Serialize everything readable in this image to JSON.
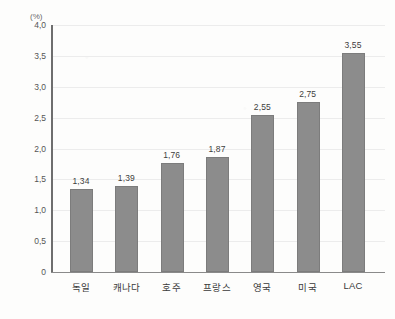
{
  "chart_data": {
    "type": "bar",
    "title": "",
    "subtitle": "",
    "xlabel": "",
    "ylabel": "GDP 중 비율",
    "unit_marker": "(%)",
    "categories": [
      "독일",
      "캐나다",
      "호주",
      "프랑스",
      "영국",
      "미국",
      "LAC"
    ],
    "values": [
      1.34,
      1.39,
      1.76,
      1.87,
      2.55,
      2.75,
      3.55
    ],
    "value_labels": [
      "1,34",
      "1,39",
      "1,76",
      "1,87",
      "2,55",
      "2,75",
      "3,55"
    ],
    "ylim": [
      0,
      4.0
    ],
    "ytick_values": [
      0,
      0.5,
      1.0,
      1.5,
      2.0,
      2.5,
      3.0,
      3.5,
      4.0
    ],
    "ytick_labels": [
      "0",
      "0,5",
      "1,0",
      "1,5",
      "2,0",
      "2,5",
      "3,0",
      "3,5",
      "4,0"
    ],
    "decimal_separator": ",",
    "grid": true,
    "grid_axis": "y",
    "legend": false,
    "legend_position": "none",
    "bar_color": "#8c8c8c",
    "bar_edge_color": "#7c7c7c",
    "gridline_color": "#ececec",
    "axis_color": "#6e6e6e",
    "value_label_color": "#3d3d3d",
    "tick_label_color": "#555555",
    "background_color": "#fdfdfc"
  }
}
